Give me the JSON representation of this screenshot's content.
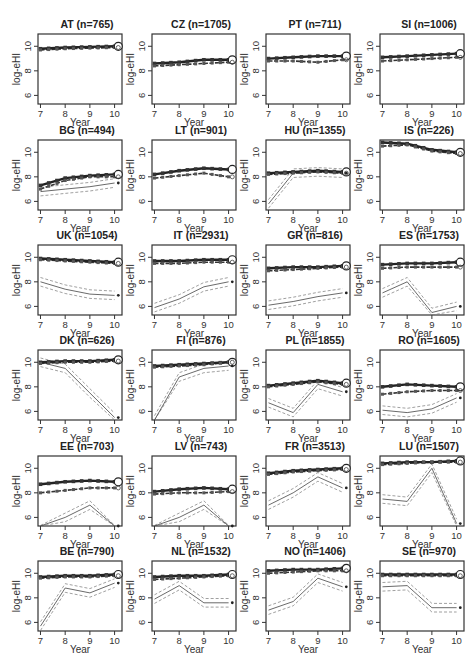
{
  "header_fragment": "(cropped text at top edge)",
  "chart_data": {
    "type": "line",
    "layout": "small multiples, 6 rows x 4 columns",
    "xlabel": "Year",
    "ylabel": "log-eHI",
    "x_ticks": [
      7,
      8,
      9,
      10
    ],
    "y_ticks": [
      6,
      8,
      10
    ],
    "xlim": [
      6.9,
      10.3
    ],
    "ylim": [
      5.3,
      11.0
    ],
    "legend": "none visible; thick bold lines = upper series (with squares), thin lines = lower series with dashed confidence band; circle and dot markers at x=10",
    "panels": [
      {
        "code": "AT",
        "n": 765,
        "title": "AT (n=765)",
        "top": [
          9.8,
          9.9,
          9.95,
          10.0
        ],
        "top2": [
          9.7,
          9.8,
          9.85,
          9.9
        ],
        "low": null
      },
      {
        "code": "CZ",
        "n": 1705,
        "title": "CZ (n=1705)",
        "top": [
          8.6,
          8.7,
          8.9,
          8.9
        ],
        "top2": [
          8.4,
          8.5,
          8.6,
          8.7
        ],
        "low": null
      },
      {
        "code": "PT",
        "n": 711,
        "title": "PT (n=711)",
        "top": [
          9.0,
          9.1,
          9.2,
          9.2
        ],
        "top2": [
          8.8,
          8.8,
          8.7,
          8.9
        ],
        "low": null
      },
      {
        "code": "SI",
        "n": 1006,
        "title": "SI (n=1006)",
        "top": [
          9.1,
          9.2,
          9.3,
          9.4
        ],
        "top2": [
          8.8,
          8.9,
          9.0,
          9.1
        ],
        "low": null
      },
      {
        "code": "BG",
        "n": 494,
        "title": "BG (n=494)",
        "top": [
          7.3,
          7.9,
          8.1,
          8.2
        ],
        "top2": [
          7.0,
          7.7,
          8.0,
          8.0
        ],
        "low": [
          6.8,
          7.0,
          7.2,
          7.5
        ]
      },
      {
        "code": "LT",
        "n": 901,
        "title": "LT (n=901)",
        "top": [
          8.2,
          8.5,
          8.7,
          8.6
        ],
        "top2": [
          7.9,
          8.1,
          8.3,
          8.0
        ],
        "low": null
      },
      {
        "code": "HU",
        "n": 1355,
        "title": "HU (n=1355)",
        "top": [
          8.3,
          8.4,
          8.5,
          8.4
        ],
        "top2": [
          8.2,
          8.3,
          8.4,
          8.3
        ],
        "low": [
          5.8,
          8.3,
          8.4,
          8.3
        ]
      },
      {
        "code": "IS",
        "n": 226,
        "title": "IS (n=226)",
        "top": [
          10.8,
          10.7,
          10.2,
          10.0
        ],
        "top2": [
          10.5,
          10.6,
          10.1,
          9.9
        ],
        "low": null
      },
      {
        "code": "UK",
        "n": 1054,
        "title": "UK (n=1054)",
        "top": [
          9.9,
          9.8,
          9.7,
          9.6
        ],
        "top2": [
          9.8,
          9.7,
          9.6,
          9.5
        ],
        "low": [
          8.0,
          7.4,
          7.0,
          6.9
        ]
      },
      {
        "code": "IT",
        "n": 2931,
        "title": "IT (n=2931)",
        "top": [
          9.7,
          9.7,
          9.8,
          9.8
        ],
        "top2": [
          9.5,
          9.5,
          9.6,
          9.6
        ],
        "low": [
          5.9,
          6.6,
          7.6,
          8.0
        ]
      },
      {
        "code": "GR",
        "n": 816,
        "title": "GR (n=816)",
        "top": [
          9.1,
          9.2,
          9.2,
          9.3
        ],
        "top2": [
          8.9,
          9.0,
          9.1,
          9.2
        ],
        "low": [
          6.1,
          6.4,
          6.8,
          7.1
        ]
      },
      {
        "code": "ES",
        "n": 1753,
        "title": "ES (n=1753)",
        "top": [
          9.4,
          9.5,
          9.5,
          9.6
        ],
        "top2": [
          9.1,
          9.2,
          9.2,
          9.2
        ],
        "low": [
          7.1,
          8.0,
          5.5,
          6.0
        ]
      },
      {
        "code": "DK",
        "n": 626,
        "title": "DK (n=626)",
        "top": [
          10.0,
          10.1,
          10.1,
          10.2
        ],
        "top2": [
          9.9,
          10.0,
          10.0,
          10.1
        ],
        "low": [
          10.0,
          9.5,
          7.5,
          5.5
        ]
      },
      {
        "code": "FI",
        "n": 876,
        "title": "FI (n=876)",
        "top": [
          9.7,
          9.8,
          9.9,
          10.0
        ],
        "top2": [
          9.6,
          9.7,
          9.8,
          10.0
        ],
        "low": [
          5.3,
          8.8,
          9.5,
          9.7
        ]
      },
      {
        "code": "PL",
        "n": 1855,
        "title": "PL (n=1855)",
        "top": [
          8.1,
          8.3,
          8.5,
          8.3
        ],
        "top2": [
          8.0,
          8.2,
          8.4,
          8.2
        ],
        "low": [
          6.7,
          5.9,
          8.2,
          7.6
        ]
      },
      {
        "code": "RO",
        "n": 1605,
        "title": "RO (n=1605)",
        "top": [
          8.0,
          8.2,
          8.1,
          8.0
        ],
        "top2": [
          7.4,
          7.6,
          7.7,
          7.7
        ],
        "low": [
          6.1,
          5.9,
          6.2,
          7.1
        ]
      },
      {
        "code": "EE",
        "n": 703,
        "title": "EE (n=703)",
        "top": [
          8.7,
          8.9,
          9.0,
          8.9
        ],
        "top2": [
          8.0,
          8.2,
          8.4,
          8.4
        ],
        "low": [
          5.0,
          6.0,
          7.0,
          5.0
        ]
      },
      {
        "code": "LV",
        "n": 743,
        "title": "LV (n=743)",
        "top": [
          8.1,
          8.3,
          8.4,
          8.3
        ],
        "top2": [
          7.9,
          8.0,
          8.0,
          8.1
        ],
        "low": [
          5.0,
          6.0,
          7.0,
          5.0
        ]
      },
      {
        "code": "FR",
        "n": 3513,
        "title": "FR (n=3513)",
        "top": [
          9.6,
          9.8,
          9.9,
          10.0
        ],
        "top2": [
          9.5,
          9.7,
          9.8,
          9.9
        ],
        "low": [
          7.0,
          8.0,
          9.3,
          8.4
        ]
      },
      {
        "code": "LU",
        "n": 1507,
        "title": "LU (n=1507)",
        "top": [
          10.4,
          10.5,
          10.5,
          10.6
        ],
        "top2": [
          10.3,
          10.4,
          10.5,
          10.5
        ],
        "low": [
          7.5,
          7.3,
          10.0,
          5.5
        ]
      },
      {
        "code": "BE",
        "n": 790,
        "title": "BE (n=790)",
        "top": [
          9.7,
          9.8,
          9.8,
          9.9
        ],
        "top2": [
          9.6,
          9.7,
          9.7,
          9.8
        ],
        "low": [
          5.7,
          8.8,
          8.4,
          9.2
        ]
      },
      {
        "code": "NL",
        "n": 1532,
        "title": "NL (n=1532)",
        "top": [
          9.7,
          9.8,
          9.8,
          9.9
        ],
        "top2": [
          9.5,
          9.6,
          9.7,
          9.8
        ],
        "low": [
          7.9,
          9.0,
          7.6,
          7.6
        ]
      },
      {
        "code": "NO",
        "n": 1406,
        "title": "NO (n=1406)",
        "top": [
          10.2,
          10.3,
          10.3,
          10.4
        ],
        "top2": [
          10.0,
          10.1,
          10.2,
          10.2
        ],
        "low": [
          7.0,
          7.7,
          9.6,
          8.9
        ]
      },
      {
        "code": "SE",
        "n": 970,
        "title": "SE (n=970)",
        "top": [
          9.9,
          9.9,
          9.9,
          9.9
        ],
        "top2": [
          9.8,
          9.8,
          9.8,
          9.8
        ],
        "low": [
          8.9,
          9.0,
          7.2,
          7.2
        ]
      }
    ]
  }
}
